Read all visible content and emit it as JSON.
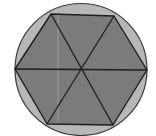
{
  "diagram": {
    "circle": {
      "cx": 81,
      "cy": 69.5,
      "r": 66,
      "fill": "#b7b7b7",
      "stroke": "#3a3a3a"
    },
    "hexagon": {
      "vertices": [
        [
          51,
          14
        ],
        [
          114,
          16
        ],
        [
          147,
          70
        ],
        [
          113,
          125
        ],
        [
          47,
          124
        ],
        [
          15,
          69
        ]
      ],
      "fill": "#7b7b7b",
      "stroke": "#1e1e1e"
    },
    "center": [
      81,
      70
    ],
    "diagonals": [
      [
        [
          51,
          14
        ],
        [
          113,
          125
        ]
      ],
      [
        [
          114,
          16
        ],
        [
          47,
          124
        ]
      ],
      [
        [
          15,
          69
        ],
        [
          147,
          70
        ]
      ]
    ],
    "artifact_line": {
      "x": 58,
      "y1": 15,
      "y2": 122,
      "stroke": "#a9a9a9"
    }
  }
}
